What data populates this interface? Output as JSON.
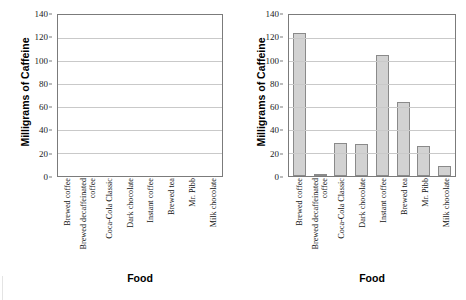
{
  "chart_data": [
    {
      "type": "bar",
      "title": "",
      "xlabel": "Food",
      "ylabel": "Milligrams of Caffeine",
      "categories": [
        "Brewed coffee",
        "Brewed decaffeinated coffee",
        "Coca-Cola Classic",
        "Dark chocolate",
        "Instant coffee",
        "Brewed tea",
        "Mr. Pibb",
        "Milk chocolate"
      ],
      "values": [
        null,
        null,
        null,
        null,
        null,
        null,
        null,
        null
      ],
      "ylim": [
        0,
        140
      ],
      "yticks": [
        0,
        20,
        40,
        60,
        80,
        100,
        120,
        140
      ],
      "grid": true,
      "legend": false,
      "note": "empty plot area - no bars drawn"
    },
    {
      "type": "bar",
      "title": "",
      "xlabel": "Food",
      "ylabel": "Milligrams of Caffeine",
      "categories": [
        "Brewed coffee",
        "Brewed decaffeinated coffee",
        "Coca-Cola Classic",
        "Dark chocolate",
        "Instant coffee",
        "Brewed tea",
        "Mr. Pibb",
        "Milk chocolate"
      ],
      "values": [
        124,
        2,
        29,
        28,
        105,
        64,
        26,
        9
      ],
      "ylim": [
        0,
        140
      ],
      "yticks": [
        0,
        20,
        40,
        60,
        80,
        100,
        120,
        140
      ],
      "grid": true,
      "legend": false,
      "bar_color": "#d2d2d2",
      "bar_border_color": "#8a8a8a"
    }
  ],
  "footer": {
    "cropped_text": " "
  }
}
